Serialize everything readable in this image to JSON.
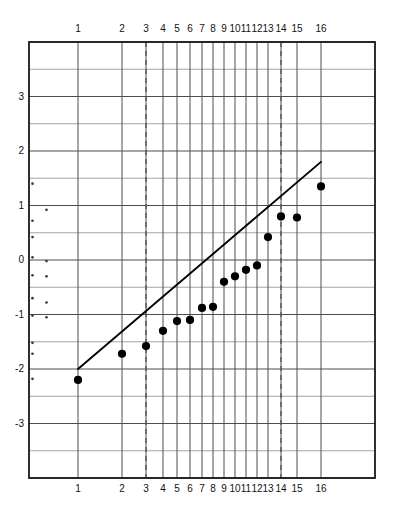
{
  "figure": {
    "kind": "normal-probability-plot",
    "background": "#ffffff",
    "axis_color": "#1a1a1a",
    "grid_color": "#4d4d4d",
    "grid_minor_color": "#9a9a9a",
    "point_color": "#000000",
    "line_color": "#000000",
    "dashed_color": "#555555",
    "rug_color": "#3a3a3a"
  },
  "chart_data": {
    "type": "scatter",
    "title": "",
    "subtitle": "",
    "xlabel": "",
    "ylabel": "",
    "grid": true,
    "legend": null,
    "x_axis": {
      "type": "rank-quantile",
      "tick_labels": [
        "1",
        "2",
        "3",
        "4",
        "5",
        "6",
        "7",
        "8",
        "9",
        "10",
        "11",
        "12",
        "13",
        "14",
        "15",
        "16"
      ],
      "tick_values": [
        1,
        2,
        3,
        4,
        5,
        6,
        7,
        8,
        9,
        10,
        11,
        12,
        13,
        14,
        15,
        16
      ],
      "tick_px": [
        78,
        122,
        146,
        163,
        177,
        190,
        202,
        213,
        224,
        235,
        246,
        257,
        268,
        281,
        297,
        321
      ],
      "labels_top": true,
      "labels_bottom": true,
      "range_px": [
        29,
        375
      ]
    },
    "y_axis": {
      "tick_labels": [
        "3",
        "2",
        "1",
        "0",
        "-1",
        "-2",
        "-3"
      ],
      "tick_values": [
        3,
        2,
        1,
        0,
        -1,
        -2,
        -3
      ],
      "ylim": [
        -4.0,
        4.0
      ],
      "major_step": 1,
      "minor_step": 0.5,
      "gridlines_at": [
        4.0,
        3.5,
        3.0,
        2.5,
        2.0,
        1.5,
        1.0,
        0.5,
        0.0,
        -0.5,
        -1.0,
        -1.5,
        -2.0,
        -2.5,
        -3.0,
        -3.5,
        -4.0
      ]
    },
    "points": [
      {
        "rank": 1,
        "x": 1,
        "y": -2.2
      },
      {
        "rank": 2,
        "x": 2,
        "y": -1.72
      },
      {
        "rank": 3,
        "x": 3,
        "y": -1.58
      },
      {
        "rank": 4,
        "x": 4,
        "y": -1.3
      },
      {
        "rank": 5,
        "x": 5,
        "y": -1.12
      },
      {
        "rank": 6,
        "x": 6,
        "y": -1.1
      },
      {
        "rank": 7,
        "x": 7,
        "y": -0.88
      },
      {
        "rank": 8,
        "x": 8,
        "y": -0.86
      },
      {
        "rank": 9,
        "x": 9,
        "y": -0.4
      },
      {
        "rank": 10,
        "x": 10,
        "y": -0.3
      },
      {
        "rank": 11,
        "x": 11,
        "y": -0.18
      },
      {
        "rank": 12,
        "x": 12,
        "y": -0.1
      },
      {
        "rank": 13,
        "x": 13,
        "y": 0.42
      },
      {
        "rank": 14,
        "x": 14,
        "y": 0.8
      },
      {
        "rank": 15,
        "x": 15,
        "y": 0.78
      },
      {
        "rank": 16,
        "x": 16,
        "y": 1.35
      }
    ],
    "fit_line": {
      "label": "",
      "x_start": 1,
      "y_start": -2.0,
      "x_end": 16,
      "y_end": 1.8
    },
    "reference_lines": [
      {
        "name": "lower-reference",
        "x": 3,
        "style": "dashed"
      },
      {
        "name": "upper-reference",
        "x": 14,
        "style": "dashed"
      }
    ],
    "rug_marks": {
      "axis": "left",
      "values": [
        1.4,
        0.92,
        0.72,
        0.42,
        0.05,
        -0.02,
        -0.28,
        -0.3,
        -0.7,
        -0.78,
        -1.02,
        -1.05,
        -1.52,
        -1.72,
        -2.18
      ],
      "paired_offsets": [
        0,
        1,
        0,
        0,
        0,
        1,
        0,
        1,
        0,
        1,
        0,
        1,
        0,
        0,
        0
      ]
    }
  }
}
